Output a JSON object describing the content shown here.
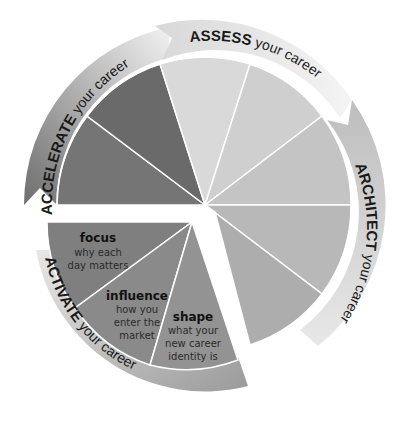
{
  "diagram": {
    "phases": [
      {
        "name": "ASSESS",
        "suffix": " your career",
        "color": "#d6d6d6",
        "ring_color": "#e2e2e2"
      },
      {
        "name": "ARCHITECT",
        "suffix": " your career",
        "color": "#bdbdbd",
        "ring_color": "#c8c8c8"
      },
      {
        "name": "ACTIVATE",
        "suffix": " your career",
        "color": "#8e8e8e",
        "ring_color": "#a9a9a9"
      },
      {
        "name": "ACCELERATE",
        "suffix": " your career",
        "color": "#707070",
        "ring_color": "#8a8a8a"
      }
    ],
    "activate_segments": [
      {
        "title": "focus",
        "line1": "why each",
        "line2": "day matters",
        "line3": ""
      },
      {
        "title": "influence",
        "line1": "how you",
        "line2": "enter the",
        "line3": "market"
      },
      {
        "title": "shape",
        "line1": "what your",
        "line2": "new career",
        "line3": "identity is"
      }
    ]
  }
}
